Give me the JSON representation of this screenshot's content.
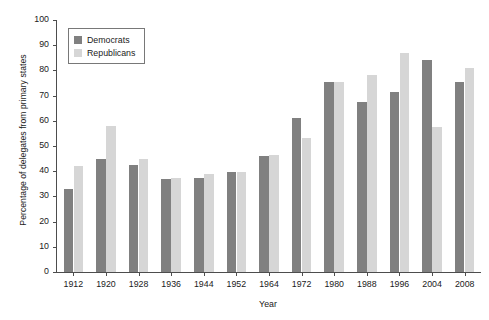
{
  "chart_data": {
    "type": "bar",
    "title": "",
    "xlabel": "Year",
    "ylabel": "Percentage of delegates from primary states",
    "ylim": [
      0,
      100
    ],
    "ytick_step": 10,
    "yticks": [
      0,
      10,
      20,
      30,
      40,
      50,
      60,
      70,
      80,
      90,
      100
    ],
    "grid": false,
    "legend_position": "upper-left-inside",
    "categories": [
      "1912",
      "1920",
      "1928",
      "1936",
      "1944",
      "1952",
      "1964",
      "1972",
      "1980",
      "1988",
      "1996",
      "2004",
      "2008"
    ],
    "series": [
      {
        "name": "Democrats",
        "color": "#808080",
        "values": [
          33,
          45,
          42.5,
          37,
          37.3,
          39.5,
          46,
          61,
          75.5,
          67.5,
          71.5,
          84,
          75.5
        ]
      },
      {
        "name": "Republicans",
        "color": "#d6d6d6",
        "values": [
          42,
          58,
          45,
          37.5,
          39,
          39.5,
          46.5,
          53,
          75.5,
          78,
          87,
          57.5,
          81
        ]
      }
    ]
  },
  "legend": {
    "entries": [
      {
        "label": "Democrats",
        "swatch": "dem"
      },
      {
        "label": "Republicans",
        "swatch": "rep"
      }
    ]
  }
}
